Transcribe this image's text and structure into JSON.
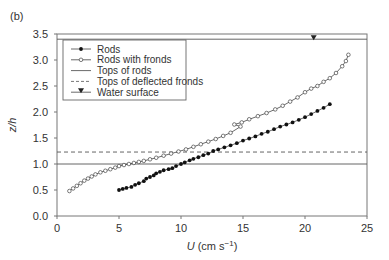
{
  "chart_data": {
    "type": "line",
    "panel_label": "(b)",
    "title": "",
    "xlabel": "U (cm s⁻¹)",
    "xlabel_parts": {
      "var": "U",
      "unit": "(cm s",
      "exp": "−1",
      "close": ")"
    },
    "ylabel": "z/h",
    "xlim": [
      0,
      25
    ],
    "ylim": [
      0,
      3.5
    ],
    "x_ticks": [
      "0",
      "5",
      "10",
      "15",
      "20",
      "25"
    ],
    "y_ticks": [
      "0.0",
      "0.5",
      "1.0",
      "1.5",
      "2.0",
      "2.5",
      "3.0",
      "3.5"
    ],
    "grid": false,
    "legend_position": "upper left",
    "legend": [
      {
        "label": "Rods",
        "style": "line-filled-dot"
      },
      {
        "label": "Rods with fronds",
        "style": "line-open-circle"
      },
      {
        "label": "Tops of rods",
        "style": "solid-line"
      },
      {
        "label": "Tops of deflected fronds",
        "style": "dashed-line"
      },
      {
        "label": "Water surface",
        "style": "filled-triangle-down"
      }
    ],
    "series": [
      {
        "name": "Rods",
        "marker": "filled",
        "x": [
          5.0,
          5.3,
          5.6,
          6.0,
          6.3,
          6.6,
          7.0,
          7.2,
          7.5,
          7.8,
          8.0,
          8.3,
          8.6,
          9.0,
          9.3,
          9.6,
          10.0,
          10.3,
          10.7,
          11.0,
          11.4,
          11.8,
          12.2,
          12.6,
          13.0,
          13.5,
          14.0,
          14.5,
          15.0,
          15.5,
          16.0,
          16.5,
          17.0,
          17.5,
          18.0,
          18.5,
          19.0,
          19.5,
          20.0,
          20.5,
          21.0,
          21.5,
          22.0
        ],
        "y": [
          0.5,
          0.52,
          0.54,
          0.56,
          0.6,
          0.63,
          0.67,
          0.72,
          0.75,
          0.78,
          0.82,
          0.85,
          0.88,
          0.9,
          0.92,
          0.96,
          1.0,
          1.03,
          1.07,
          1.1,
          1.13,
          1.17,
          1.2,
          1.25,
          1.28,
          1.32,
          1.36,
          1.4,
          1.45,
          1.49,
          1.53,
          1.58,
          1.62,
          1.67,
          1.72,
          1.76,
          1.8,
          1.85,
          1.9,
          1.96,
          2.02,
          2.08,
          2.15
        ]
      },
      {
        "name": "Rods with fronds",
        "marker": "open",
        "x": [
          1.0,
          1.3,
          1.6,
          1.9,
          2.2,
          2.5,
          2.8,
          3.1,
          3.5,
          3.9,
          4.3,
          4.7,
          5.0,
          5.4,
          5.8,
          6.2,
          6.6,
          7.0,
          7.5,
          8.0,
          8.6,
          9.2,
          9.8,
          10.4,
          11.0,
          11.6,
          12.2,
          12.8,
          13.4,
          14.0,
          14.8,
          14.3,
          14.9,
          15.5,
          16.2,
          16.9,
          17.6,
          18.2,
          18.8,
          19.4,
          20.0,
          20.5,
          21.0,
          21.5,
          22.0,
          22.5,
          23.0,
          23.3,
          23.5
        ],
        "y": [
          0.48,
          0.53,
          0.58,
          0.63,
          0.68,
          0.72,
          0.76,
          0.8,
          0.84,
          0.87,
          0.9,
          0.93,
          0.96,
          0.98,
          1.0,
          1.02,
          1.04,
          1.06,
          1.09,
          1.12,
          1.16,
          1.2,
          1.24,
          1.28,
          1.33,
          1.38,
          1.43,
          1.48,
          1.54,
          1.6,
          1.72,
          1.76,
          1.8,
          1.86,
          1.92,
          1.98,
          2.05,
          2.12,
          2.2,
          2.28,
          2.38,
          2.45,
          2.5,
          2.58,
          2.65,
          2.75,
          2.88,
          2.98,
          3.1
        ]
      }
    ],
    "reference_lines": [
      {
        "name": "Tops of rods",
        "y": 1.0,
        "style": "solid"
      },
      {
        "name": "Tops of deflected fronds",
        "y": 1.23,
        "style": "dashed"
      },
      {
        "name": "Water surface",
        "y": 3.4,
        "style": "solid",
        "marker_x": 20.7
      }
    ]
  }
}
